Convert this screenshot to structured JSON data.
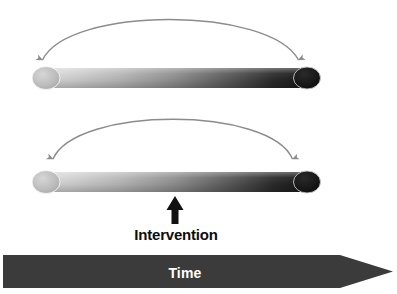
{
  "diagram": {
    "title_text_elements": {
      "intervention_label": "Intervention",
      "time_label": "Time"
    },
    "background_color": "#ffffff",
    "bars": [
      {
        "name": "trajectory-bar-top",
        "left_x": 38,
        "right_x": 312,
        "center_y": 78,
        "height": 20,
        "gradient_start_color": "#d9d9d9",
        "gradient_end_color": "#141414",
        "left_cap_color": "#b3b3b3",
        "right_cap_color": "#111111"
      },
      {
        "name": "trajectory-bar-bottom",
        "left_x": 38,
        "right_x": 312,
        "center_y": 182,
        "height": 20,
        "gradient_start_color": "#d9d9d9",
        "gradient_end_color": "#141414",
        "left_cap_color": "#b3b3b3",
        "right_cap_color": "#111111"
      }
    ],
    "arcs": [
      {
        "name": "span-arc-top",
        "stroke_color": "#8c8c8c",
        "start_x": 42,
        "start_y": 64,
        "end_x": 299,
        "end_y": 64,
        "apex_y": 10,
        "arrowheads": "both-ends-down"
      },
      {
        "name": "span-arc-bottom",
        "stroke_color": "#8c8c8c",
        "start_x": 52,
        "start_y": 163,
        "end_x": 293,
        "end_y": 163,
        "apex_y": 110,
        "arrowheads": "both-ends-down"
      }
    ],
    "intervention_arrow": {
      "name": "intervention-arrow",
      "color": "#111111",
      "x": 175,
      "tip_y": 197,
      "tail_y": 224
    },
    "time_banner": {
      "name": "time-axis-banner",
      "fill_color": "#3b3b3b",
      "left_x": 3,
      "body_right_x": 340,
      "tip_x": 393,
      "top_y": 255,
      "bottom_y": 288,
      "text_color": "#ffffff"
    }
  }
}
